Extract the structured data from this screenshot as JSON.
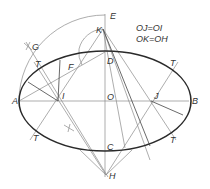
{
  "diagram": {
    "equations": [
      "OJ=OI",
      "OK=OH"
    ],
    "points": [
      {
        "label": "E",
        "x": 108,
        "y": 14
      },
      {
        "label": "K",
        "x": 103,
        "y": 29
      },
      {
        "label": "D",
        "x": 105,
        "y": 52
      },
      {
        "label": "G",
        "x": 30,
        "y": 47
      },
      {
        "label": "F",
        "x": 70,
        "y": 68
      },
      {
        "label": "A",
        "x": 19,
        "y": 101
      },
      {
        "label": "I",
        "x": 58,
        "y": 101
      },
      {
        "label": "O",
        "x": 105,
        "y": 101
      },
      {
        "label": "J",
        "x": 151,
        "y": 101
      },
      {
        "label": "B",
        "x": 189,
        "y": 101
      },
      {
        "label": "C",
        "x": 105,
        "y": 151
      },
      {
        "label": "H",
        "x": 106,
        "y": 175
      }
    ],
    "tangent_labels": [
      "T",
      "T",
      "T",
      "T"
    ],
    "colors": {
      "construction_line": "#8a8a8a",
      "ellipse_curve": "#2a2a2a",
      "text": "#333333"
    }
  }
}
